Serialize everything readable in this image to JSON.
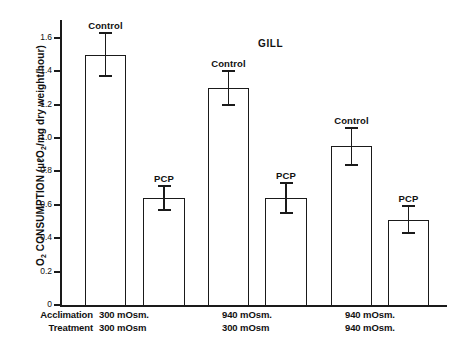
{
  "chart_data": {
    "type": "bar",
    "title": "GILL",
    "xlabel": "",
    "ylabel": "O2 CONSUMPTION (µℓO2/mg dry weight/hour)",
    "ylim": [
      0,
      1.7
    ],
    "ytick_labels": [
      "0",
      "0.2",
      "0.4",
      "0.6",
      "0.8",
      "1.0",
      "1.2",
      "1.4",
      "1.6"
    ],
    "ytick_values": [
      0,
      0.2,
      0.4,
      0.6,
      0.8,
      1.0,
      1.2,
      1.4,
      1.6
    ],
    "grid": false,
    "legend": "none",
    "groups": [
      {
        "acclimation": "300 mOsm.",
        "treatment": "300 mOsm",
        "bars": [
          {
            "label": "Control",
            "value": 1.5,
            "err_upper": 0.13,
            "err_lower": 0.13
          },
          {
            "label": "PCP",
            "value": 0.64,
            "err_upper": 0.07,
            "err_lower": 0.07
          }
        ]
      },
      {
        "acclimation": "940 mOsm.",
        "treatment": "300 mOsm",
        "bars": [
          {
            "label": "Control",
            "value": 1.3,
            "err_upper": 0.1,
            "err_lower": 0.1
          },
          {
            "label": "PCP",
            "value": 0.64,
            "err_upper": 0.09,
            "err_lower": 0.09
          }
        ]
      },
      {
        "acclimation": "940 mOsm.",
        "treatment": "940 mOsm.",
        "bars": [
          {
            "label": "Control",
            "value": 0.95,
            "err_upper": 0.11,
            "err_lower": 0.11
          },
          {
            "label": "PCP",
            "value": 0.51,
            "err_upper": 0.08,
            "err_lower": 0.08
          }
        ]
      }
    ]
  },
  "axis": {
    "y_title_main": "O",
    "y_title_sub1": "2",
    "y_title_mid": " CONSUMPTION (µℓO",
    "y_title_sub2": "2",
    "y_title_end": "/mg dry weight/hour)",
    "ticks": [
      {
        "value": 0,
        "label": "0"
      },
      {
        "value": 0.2,
        "label": "0.2"
      },
      {
        "value": 0.4,
        "label": "0.4"
      },
      {
        "value": 0.6,
        "label": "0.6"
      },
      {
        "value": 0.8,
        "label": "0.8"
      },
      {
        "value": 1.0,
        "label": "1.0"
      },
      {
        "value": 1.2,
        "label": "1.2"
      },
      {
        "value": 1.4,
        "label": "1.4"
      },
      {
        "value": 1.6,
        "label": "1.6"
      }
    ]
  },
  "row_labels": {
    "acclimation": "Acclimation",
    "treatment": "Treatment"
  },
  "title": "GILL"
}
